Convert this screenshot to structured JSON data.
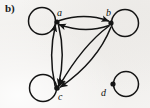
{
  "figure": {
    "panel_label": "b)",
    "caption": "",
    "background_color": "#f2f1ef",
    "ink_color": "#141414",
    "width": 150,
    "height": 108
  },
  "graph": {
    "type": "directed-multigraph",
    "vertex_count": 4,
    "edge_count": 10,
    "vertices": [
      {
        "id": "a",
        "label": "a",
        "x": 57,
        "y": 22,
        "dot_radius": 2.6,
        "loop": {
          "present": true,
          "side": "left",
          "cx": 42,
          "cy": 21,
          "r": 13.5
        }
      },
      {
        "id": "b",
        "label": "b",
        "x": 111,
        "y": 23,
        "dot_radius": 2.6,
        "loop": {
          "present": true,
          "side": "right",
          "cx": 125,
          "cy": 23,
          "r": 13.5
        }
      },
      {
        "id": "c",
        "label": "c",
        "x": 57,
        "y": 88,
        "dot_radius": 2.8,
        "loop": {
          "present": true,
          "side": "left",
          "cx": 43,
          "cy": 88,
          "r": 13.5
        }
      },
      {
        "id": "d",
        "label": "d",
        "x": 113,
        "y": 84,
        "dot_radius": 2.6,
        "loop": {
          "present": true,
          "side": "right",
          "cx": 126,
          "cy": 84,
          "r": 12.5
        }
      }
    ],
    "edges": [
      {
        "id": "a-b-top",
        "from": "a",
        "to": "b",
        "style": "curved",
        "arrow_at": "b"
      },
      {
        "id": "b-a-bottom",
        "from": "b",
        "to": "a",
        "style": "curved",
        "arrow_at": "a"
      },
      {
        "id": "c-a-left",
        "from": "c",
        "to": "a",
        "style": "curved",
        "arrow_at": "a"
      },
      {
        "id": "a-c-right",
        "from": "a",
        "to": "c",
        "style": "curved",
        "arrow_at": "c"
      },
      {
        "id": "b-c-upper",
        "from": "b",
        "to": "c",
        "style": "curved",
        "arrow_at": "c"
      },
      {
        "id": "b-c-lower",
        "from": "b",
        "to": "c",
        "style": "curved",
        "arrow_at": "c"
      },
      {
        "id": "loop-a",
        "from": "a",
        "to": "a",
        "style": "self-loop",
        "arrow_at": "a"
      },
      {
        "id": "loop-b",
        "from": "b",
        "to": "b",
        "style": "self-loop",
        "arrow_at": "b"
      },
      {
        "id": "loop-c",
        "from": "c",
        "to": "c",
        "style": "self-loop",
        "arrow_at": "c"
      },
      {
        "id": "loop-d",
        "from": "d",
        "to": "d",
        "style": "self-loop",
        "arrow_at": "d"
      }
    ]
  }
}
